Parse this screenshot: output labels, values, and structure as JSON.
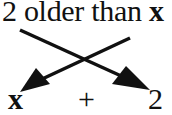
{
  "diagram": {
    "top_phrase": {
      "prefix": "2 older than ",
      "variable": "x"
    },
    "bottom_expression": {
      "left": "x",
      "operator": "+",
      "right": "2"
    },
    "arrows": [
      {
        "from": "2",
        "to": "2",
        "direction": "down-right"
      },
      {
        "from": "x",
        "to": "x",
        "direction": "down-left"
      }
    ]
  }
}
